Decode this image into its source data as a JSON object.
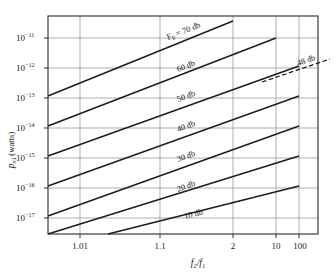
{
  "chart_data": {
    "type": "line",
    "title": "",
    "xlabel": "f2/f1",
    "ylabel": "p_n1 (watts)",
    "ylabel_parts": {
      "symbol": "p",
      "subscript": "n1",
      "unit": "(watts)"
    },
    "xlabel_parts": {
      "num": "f",
      "num_sub": "2",
      "den": "f",
      "den_sub": "1"
    },
    "xscale": "log-log-of-ratio",
    "yscale": "log",
    "xticks": [
      "1.01",
      "1.1",
      "2",
      "10",
      "100"
    ],
    "yticks": [
      "10^-11",
      "10^-12",
      "10^-13",
      "10^-14",
      "10^-15",
      "10^-16",
      "10^-17"
    ],
    "ytick_labels": [
      {
        "mantissa": "10",
        "exponent": "−11"
      },
      {
        "mantissa": "10",
        "exponent": "−12"
      },
      {
        "mantissa": "10",
        "exponent": "−13"
      },
      {
        "mantissa": "10",
        "exponent": "−14"
      },
      {
        "mantissa": "10",
        "exponent": "−15"
      },
      {
        "mantissa": "10",
        "exponent": "−16"
      },
      {
        "mantissa": "10",
        "exponent": "−17"
      }
    ],
    "ylim": [
      "10^-17.6",
      "10^-10.55"
    ],
    "grid": true,
    "legend": "inline-curve-labels",
    "series": [
      {
        "name": "F0 = 70 db",
        "label": "F₀ = 70 db",
        "db": 70,
        "style": "solid",
        "x_start": 1.01,
        "x_end": 2.0,
        "y_start": 1.3e-13,
        "y_end": 1.1e-11
      },
      {
        "name": "60 db",
        "label": "60 db",
        "db": 60,
        "style": "solid",
        "x_start": 1.01,
        "x_end": 10,
        "y_start": 1.3e-14,
        "y_end": 1.1e-11
      },
      {
        "name": "50 db",
        "label": "50 db",
        "db": 50,
        "style": "solid",
        "x_start": 1.01,
        "x_end": 100,
        "y_start": 1.3e-15,
        "y_end": 1.2e-12
      },
      {
        "name": "48 db",
        "label": "48 db",
        "db": 48,
        "style": "dashed",
        "x_start": 10,
        "x_end": 100,
        "y_start": 2.3e-13,
        "y_end": 1e-12
      },
      {
        "name": "40 db",
        "label": "40 db",
        "db": 40,
        "style": "solid",
        "x_start": 1.01,
        "x_end": 100,
        "y_start": 1.3e-16,
        "y_end": 1.2e-13
      },
      {
        "name": "30 db",
        "label": "30 db",
        "db": 30,
        "style": "solid",
        "x_start": 1.01,
        "x_end": 100,
        "y_start": 1.3e-17,
        "y_end": 1.2e-14
      },
      {
        "name": "20 db",
        "label": "20 db",
        "db": 20,
        "style": "solid",
        "x_start": 1.01,
        "x_end": 100,
        "y_start": 1.4e-18,
        "y_end": 1.2e-15
      },
      {
        "name": "10 db",
        "label": "10 db",
        "db": 10,
        "style": "solid",
        "x_start": 1.1,
        "x_end": 100,
        "y_start": 1.4e-18,
        "y_end": 1.2e-16
      }
    ]
  },
  "figure": {
    "background": "#ffffff",
    "line_color": "#1c1c1c",
    "grid_color": "#8c8c8c",
    "frame_color": "#2a2a2a"
  }
}
